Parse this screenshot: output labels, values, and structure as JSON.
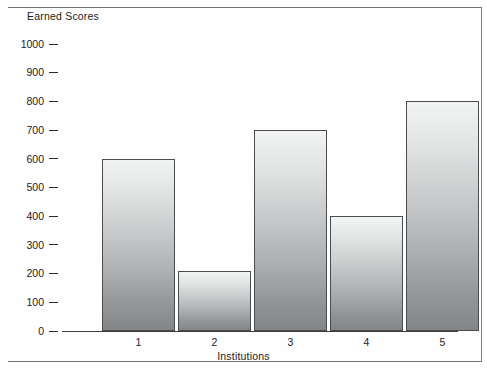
{
  "chart_data": {
    "type": "bar",
    "title": "",
    "xlabel": "Institutions",
    "ylabel": "Earned Scores",
    "categories": [
      "1",
      "2",
      "3",
      "4",
      "5"
    ],
    "values": [
      600,
      210,
      700,
      400,
      800
    ],
    "ylim": [
      0,
      1000
    ],
    "yticks": [
      0,
      100,
      200,
      300,
      400,
      500,
      600,
      700,
      800,
      900,
      1000
    ],
    "ytick_labels": [
      "0",
      "100",
      "200",
      "300",
      "400",
      "500",
      "600",
      "700",
      "800",
      "900",
      "1000"
    ],
    "grid": false,
    "legend": null,
    "series": [
      {
        "name": "Earned Scores",
        "values": [
          600,
          210,
          700,
          400,
          800
        ]
      }
    ],
    "colors": {
      "bar_top": "#f2f3f3",
      "bar_bottom": "#848586",
      "bar_border": "#4a4c4f",
      "axis": "#3b3d40",
      "text": "#1c1c1c",
      "frame": "#6f7174",
      "background": "#fefefe"
    }
  }
}
